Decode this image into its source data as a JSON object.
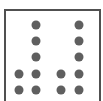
{
  "figure": {
    "frame_color": "#505050",
    "dot_color": "#5f5f5f",
    "dot_diameter": 9,
    "dots": [
      {
        "x": 36,
        "y": 25
      },
      {
        "x": 79,
        "y": 25
      },
      {
        "x": 36,
        "y": 41
      },
      {
        "x": 79,
        "y": 41
      },
      {
        "x": 36,
        "y": 57
      },
      {
        "x": 79,
        "y": 57
      },
      {
        "x": 19,
        "y": 74
      },
      {
        "x": 36,
        "y": 74
      },
      {
        "x": 61,
        "y": 74
      },
      {
        "x": 79,
        "y": 74
      },
      {
        "x": 19,
        "y": 90
      },
      {
        "x": 36,
        "y": 90
      },
      {
        "x": 61,
        "y": 90
      },
      {
        "x": 79,
        "y": 90
      }
    ]
  }
}
